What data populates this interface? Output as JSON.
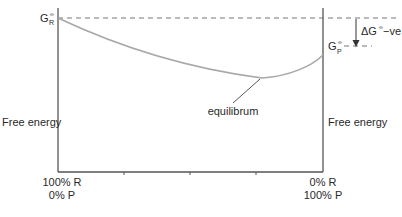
{
  "diagram": {
    "type": "free-energy-reaction-progress",
    "left_axis_label": "Free energy",
    "right_axis_label": "Free energy",
    "x_axis": {
      "left_label_line1": "100% R",
      "left_label_line2": "0% P",
      "right_label_line1": "0% R",
      "right_label_line2": "100% P",
      "tick_count": 3
    },
    "reactant_level": {
      "symbol": "G",
      "superscript": "⦵",
      "subscript": "R"
    },
    "product_level": {
      "symbol": "G",
      "superscript": "⦵",
      "subscript": "P"
    },
    "delta_label": {
      "text": "ΔG",
      "superscript": "⦵",
      "suffix": " −ve"
    },
    "minimum_label": "equilibrum",
    "colors": {
      "axis": "#555555",
      "curve": "#a8a8a8",
      "dashed": "#777777",
      "text": "#2a2a2a"
    }
  }
}
